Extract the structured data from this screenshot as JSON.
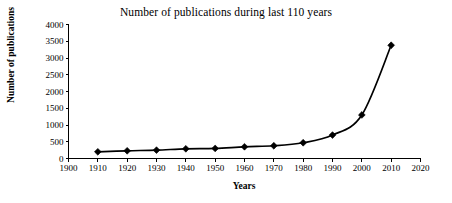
{
  "chart_data": {
    "type": "line",
    "title": "Number of publications during last 110 years",
    "xlabel": "Years",
    "ylabel": "Number of publications",
    "x": [
      1910,
      1920,
      1930,
      1940,
      1950,
      1960,
      1970,
      1980,
      1990,
      2000,
      2010
    ],
    "values": [
      200,
      230,
      250,
      290,
      300,
      350,
      380,
      470,
      700,
      1300,
      3380
    ],
    "series": [
      {
        "name": "Number of publications",
        "values": [
          200,
          230,
          250,
          290,
          300,
          350,
          380,
          470,
          700,
          1300,
          3380
        ]
      }
    ],
    "xlim": [
      1900,
      2020
    ],
    "ylim": [
      0,
      4000
    ],
    "x_ticks": [
      1900,
      1910,
      1920,
      1930,
      1940,
      1950,
      1960,
      1970,
      1980,
      1990,
      2000,
      2010,
      2020
    ],
    "x_tick_labels": [
      "1900",
      "1910",
      "1920",
      "1930",
      "1940",
      "1950",
      "1960",
      "1970",
      "1980",
      "1990",
      "2000",
      "2010",
      "2020"
    ],
    "y_ticks": [
      0,
      500,
      1000,
      1500,
      2000,
      2500,
      3000,
      3500,
      4000
    ],
    "y_tick_labels": [
      "0",
      "500",
      "1000",
      "1500",
      "2000",
      "2500",
      "3000",
      "3500",
      "4000"
    ],
    "grid": false,
    "legend": false,
    "marker": "diamond",
    "line_color": "#000000",
    "marker_color": "#000000",
    "background_color": "#ffffff"
  }
}
